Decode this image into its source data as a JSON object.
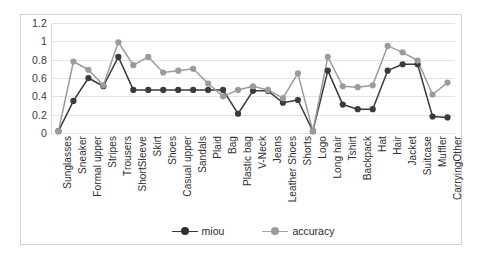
{
  "chart_data": {
    "type": "line",
    "title": "",
    "xlabel": "",
    "ylabel": "",
    "ylim": [
      0,
      1.2
    ],
    "yticks": [
      0,
      0.2,
      0.4,
      0.6,
      0.8,
      1,
      1.2
    ],
    "ytick_labels": [
      "0",
      "0.2",
      "0.4",
      "0.6",
      "0.8",
      "1",
      "1.2"
    ],
    "grid": true,
    "legend_position": "bottom",
    "categories": [
      "Sunglasses",
      "Sneaker",
      "Formal upper",
      "Stripes",
      "Trousers",
      "ShortSleeve",
      "Skirt",
      "Shoes",
      "Casual upper",
      "Sandals",
      "Plaid",
      "Bag",
      "Plastic bag",
      "V-Neck",
      "Jeans",
      "Leather Shoes",
      "Shorts",
      "Logo",
      "Long hair",
      "Tshirt",
      "Backpack",
      "Hat",
      "Hair",
      "Jacket",
      "Suitcase",
      "Muffler",
      "CarryingOther"
    ],
    "series": [
      {
        "name": "miou",
        "color": "#3b3b3b",
        "values": [
          0.02,
          0.35,
          0.6,
          0.51,
          0.83,
          0.47,
          0.47,
          0.47,
          0.47,
          0.47,
          0.47,
          0.47,
          0.21,
          0.46,
          0.46,
          0.33,
          0.36,
          0.02,
          0.68,
          0.31,
          0.26,
          0.26,
          0.68,
          0.75,
          0.75,
          0.18,
          0.17
        ]
      },
      {
        "name": "accuracy",
        "color": "#9b9b9b",
        "values": [
          0.02,
          0.78,
          0.69,
          0.52,
          0.99,
          0.74,
          0.83,
          0.66,
          0.68,
          0.7,
          0.54,
          0.4,
          0.47,
          0.51,
          0.47,
          0.38,
          0.65,
          0.02,
          0.83,
          0.51,
          0.5,
          0.52,
          0.95,
          0.88,
          0.79,
          0.42,
          0.55
        ]
      }
    ]
  },
  "legend": {
    "items": [
      {
        "label": "miou"
      },
      {
        "label": "accuracy"
      }
    ]
  }
}
